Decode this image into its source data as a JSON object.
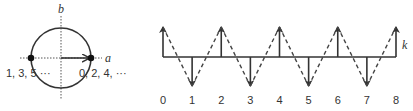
{
  "figure": {
    "left_panel": {
      "description": "Unit circle in the a-b plane with two marked points",
      "axis_labels": {
        "horizontal": "a",
        "vertical": "b"
      },
      "center": [
        61,
        58
      ],
      "radius": 30,
      "points": [
        {
          "position": "left",
          "label": "1, 3, 5 ···"
        },
        {
          "position": "right",
          "label": "0, 2, 4, ···"
        }
      ],
      "arrow": "from center to right point"
    },
    "right_panel": {
      "description": "Alternating up/down arrows along k axis with dashed zigzag",
      "axis_label": "k",
      "tick_labels": [
        "0",
        "1",
        "2",
        "3",
        "4",
        "5",
        "6",
        "7",
        "8"
      ],
      "arrow_directions": [
        "up",
        "down",
        "up",
        "down",
        "up",
        "down",
        "up",
        "down",
        "up"
      ]
    }
  },
  "colors": {
    "line": "#333333",
    "dotted": "#555555"
  }
}
